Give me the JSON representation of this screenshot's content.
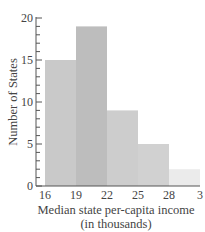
{
  "chart_data": {
    "type": "bar",
    "histogram": true,
    "title": "",
    "xlabel": "Median state per-capita income",
    "xlabel_line2": "(in thousands)",
    "ylabel": "Number of States",
    "bins": [
      16,
      19,
      22,
      25,
      28,
      31
    ],
    "categories": [
      "16-19",
      "19-22",
      "22-25",
      "25-28",
      "28-31"
    ],
    "values": [
      15,
      19,
      9,
      5,
      2
    ],
    "x_tick_labels": [
      "16",
      "19",
      "22",
      "25",
      "28",
      "3"
    ],
    "y_tick_labels": [
      "0",
      "5",
      "10",
      "15",
      "20"
    ],
    "ylim": [
      0,
      20
    ],
    "xlim": [
      16,
      31
    ],
    "y_minor_tick_step": 1,
    "grid": false,
    "legend": null,
    "bar_colors": [
      "#c9c9c9",
      "#bdbdbd",
      "#cdcdcd",
      "#d1d1d1",
      "#ebebeb"
    ]
  }
}
